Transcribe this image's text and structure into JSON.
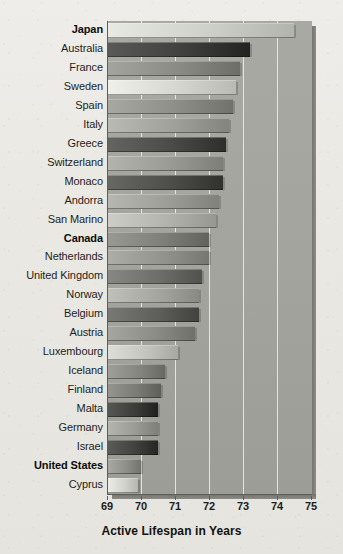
{
  "chart_data": {
    "type": "bar",
    "orientation": "horizontal",
    "title": "",
    "xlabel": "Active Lifespan in Years",
    "ylabel": "",
    "xlim": [
      69,
      75
    ],
    "xticks": [
      69,
      70,
      71,
      72,
      73,
      74,
      75
    ],
    "grid": true,
    "legend": "none",
    "categories": [
      "Japan",
      "Australia",
      "France",
      "Sweden",
      "Spain",
      "Italy",
      "Greece",
      "Switzerland",
      "Monaco",
      "Andorra",
      "San Marino",
      "Canada",
      "Netherlands",
      "United Kingdom",
      "Norway",
      "Belgium",
      "Austria",
      "Luxembourg",
      "Iceland",
      "Finland",
      "Malta",
      "Germany",
      "Israel",
      "United States",
      "Cyprus"
    ],
    "values": [
      74.5,
      73.2,
      72.9,
      72.8,
      72.7,
      72.6,
      72.5,
      72.4,
      72.4,
      72.3,
      72.2,
      72.0,
      72.0,
      71.8,
      71.7,
      71.7,
      71.6,
      71.1,
      70.7,
      70.6,
      70.5,
      70.5,
      70.5,
      70.0,
      69.9
    ],
    "emphasized": [
      "Japan",
      "Canada",
      "United States"
    ],
    "bar_shades": [
      "#cfcfca",
      "#3f3f3d",
      "#8a8a85",
      "#d6d6d1",
      "#8e8e89",
      "#a0a09b",
      "#4a4a47",
      "#9a9a95",
      "#4d4d4a",
      "#9d9d98",
      "#b3b3ae",
      "#7f7f7a",
      "#93938e",
      "#6d6d69",
      "#a6a6a1",
      "#5e5e5b",
      "#8c8c87",
      "#c4c4bf",
      "#85858000",
      "#7b7b76",
      "#3c3c3a",
      "#9b9b96",
      "#414140",
      "#8f8f8a",
      "#d2d2cd"
    ],
    "background_color": "#a5a5a0",
    "paper_color": "#eceae4",
    "axis_color": "#5d5d59"
  },
  "axis": {
    "ticks": [
      "69",
      "70",
      "71",
      "72",
      "73",
      "74",
      "75"
    ],
    "xlabel": "Active Lifespan in Years"
  }
}
